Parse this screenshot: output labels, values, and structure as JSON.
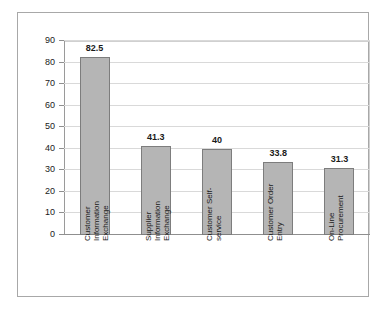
{
  "chart_data": {
    "type": "bar",
    "title": "",
    "subtitle": "",
    "xlabel": "",
    "ylabel": "",
    "ylim": [
      0,
      90
    ],
    "ytick_step": 10,
    "yticks": [
      90,
      80,
      70,
      60,
      50,
      40,
      30,
      20,
      10,
      0
    ],
    "grid": true,
    "grid_axis": "y",
    "legend": false,
    "legend_position": "none",
    "data_labels": true,
    "categories": [
      "Customer Information Exchange",
      "Supplier Information Exchange",
      "Customer Self-service",
      "Customer Order Entry",
      "On-Line Procurement"
    ],
    "category_lines": [
      [
        "Customer",
        "Information",
        "Exchange"
      ],
      [
        "Supplier",
        "Information",
        "Exchange"
      ],
      [
        "Customer Self-",
        "service"
      ],
      [
        "Customer Order",
        "Entry"
      ],
      [
        "On-Line",
        "Procurement"
      ]
    ],
    "values": [
      82.5,
      41.3,
      40,
      33.8,
      31.3
    ],
    "value_labels": [
      "82.5",
      "41.3",
      "40",
      "33.8",
      "31.3"
    ],
    "colors": {
      "bar_fill": "#b5b5b5",
      "bar_border": "#7d7d7d",
      "gridline": "#d9d9d9",
      "axis": "#8f8f8f",
      "plot_background": "#ffffff",
      "chart_border": "#a8a8a8",
      "text": "#1a1a1a"
    }
  }
}
